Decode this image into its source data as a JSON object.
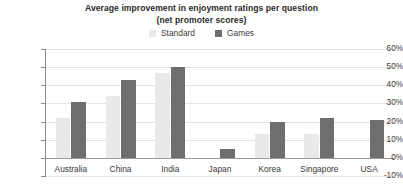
{
  "chart_data": {
    "type": "bar",
    "title": "Average improvement in enjoyment ratings per question (net promoter scores)",
    "title_lines": [
      "Average improvement in enjoyment ratings per question",
      "(net promoter scores)"
    ],
    "xlabel": "",
    "ylabel": "",
    "ylim": [
      -10,
      60
    ],
    "ytick_labels": [
      "60%",
      "50%",
      "40%",
      "30%",
      "20%",
      "10%",
      "0%",
      "-10%"
    ],
    "ytick_values": [
      60,
      50,
      40,
      30,
      20,
      10,
      0,
      -10
    ],
    "grid": true,
    "legend_position": "top-center",
    "categories": [
      "Australia",
      "China",
      "India",
      "Japan",
      "Korea",
      "Singapore",
      "USA"
    ],
    "series": [
      {
        "name": "Standard",
        "color": "#e9e9e9",
        "values": [
          22,
          34,
          47,
          0,
          13,
          13,
          0
        ]
      },
      {
        "name": "Games",
        "color": "#6e6e6e",
        "values": [
          31,
          43,
          50,
          5,
          20,
          22,
          21
        ]
      }
    ]
  },
  "legend": {
    "items": [
      {
        "label": "Standard",
        "color": "#e9e9e9"
      },
      {
        "label": "Games",
        "color": "#6e6e6e"
      }
    ]
  },
  "axis": {
    "zero_label": "0%",
    "baseline_color": "#9a9a9a",
    "grid_color": "#e3e3e3",
    "spine_color": "#8c8c8c"
  }
}
